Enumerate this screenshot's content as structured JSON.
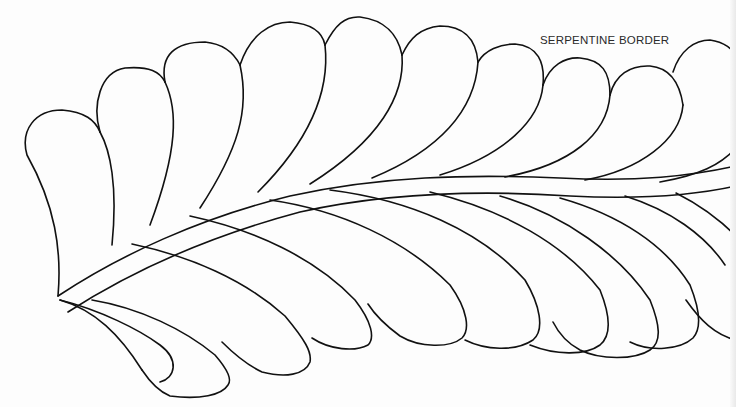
{
  "title": "SERPENTINE BORDER",
  "figure": {
    "type": "quilting-pattern-line-art",
    "top_feather_count": 11,
    "bottom_feather_count": 9,
    "line_color": "#111111",
    "background_color": "#fdfdfd"
  }
}
